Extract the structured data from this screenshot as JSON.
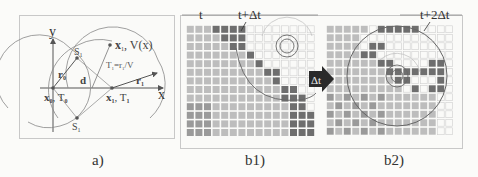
{
  "figure": {
    "panels": [
      {
        "id": "a",
        "caption": "a)",
        "axis_labels": {
          "x": "x",
          "y": "y"
        },
        "labels": {
          "S_top": "S",
          "S_top_sub": "1",
          "S_bottom": "S",
          "S_bottom_sub": "1",
          "r0": "r",
          "r0_sub": "0",
          "r1": "r",
          "r1_sub": "1",
          "d": "d",
          "x0T0": "x",
          "x0T0_sub": "0",
          "x0T0_T": ", T",
          "x0T0_T_sub": "0",
          "x1T1": "x",
          "x1T1_sub": "1",
          "x1T1_T": ", T",
          "x1T1_T_sub": "1",
          "x1V": "x",
          "x1V_sub": "1",
          "x1V_rest": ", V(x)",
          "formula": "T",
          "formula_sub": "1",
          "formula_rest": "=r",
          "formula_sub2": "1",
          "formula_tail": "/V"
        }
      },
      {
        "id": "b1",
        "caption": "b1)",
        "labels": {
          "t": "t",
          "t_plus_dt": "t+Δt"
        }
      },
      {
        "id": "b2",
        "caption": "b2)",
        "labels": {
          "t_plus_2dt": "t+2Δt"
        }
      }
    ],
    "arrow_label": "Δt",
    "colors": {
      "line": "#555555",
      "arc": "#777777",
      "grid_light": "#cfcfcf",
      "cell_dark": "#6e6e6e",
      "cell_mid": "#9a9a9a",
      "cell_light": "#bdbdbd",
      "arrow_fill": "#2a2a2a"
    }
  }
}
